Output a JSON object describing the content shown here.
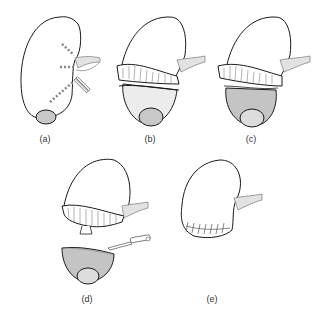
{
  "figure": {
    "panels": [
      {
        "id": "a",
        "label": "(a)",
        "description": "Kidney with lower pole tumor; dashed vessel lines and clamp at hilum"
      },
      {
        "id": "b",
        "label": "(b)",
        "description": "Kidney with lower pole wrapped by compression band, hilum clamped"
      },
      {
        "id": "c",
        "label": "(c)",
        "description": "Lower pole shaded for excision below compression band"
      },
      {
        "id": "d",
        "label": "(d)",
        "description": "Lower pole with tumor excised using scalpel"
      },
      {
        "id": "e",
        "label": "(e)",
        "description": "Kidney remnant with sutured closure at lower pole"
      }
    ]
  },
  "colors": {
    "outline": "#1a1a1a",
    "tumor": "#c8c8c8",
    "shade": "#d6d6d6",
    "vessel": "#e2e2e2"
  }
}
